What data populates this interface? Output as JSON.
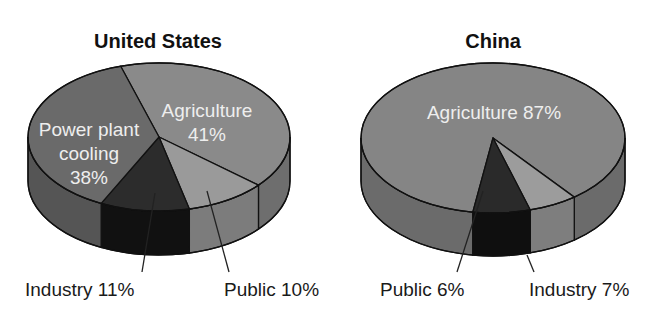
{
  "chart_data": [
    {
      "type": "pie",
      "style": "3d",
      "title": "United States",
      "slices": [
        {
          "label": "Agriculture",
          "value": 41,
          "display": [
            "Agriculture",
            "41%"
          ],
          "label_position": "inside",
          "color_top": "#8a8a8a",
          "color_side": "#6e6e6e"
        },
        {
          "label": "Public",
          "value": 10,
          "display": [
            "Public 10%"
          ],
          "label_position": "outside-below",
          "color_top": "#9a9a9a",
          "color_side": "#7c7c7c"
        },
        {
          "label": "Industry",
          "value": 11,
          "display": [
            "Industry 11%"
          ],
          "label_position": "outside-below",
          "color_top": "#2c2c2c",
          "color_side": "#111111"
        },
        {
          "label": "Power plant cooling",
          "value": 38,
          "display": [
            "Power plant",
            "cooling",
            "38%"
          ],
          "label_position": "inside",
          "color_top": "#6a6a6a",
          "color_side": "#555555"
        }
      ]
    },
    {
      "type": "pie",
      "style": "3d",
      "title": "China",
      "slices": [
        {
          "label": "Agriculture",
          "value": 87,
          "display": [
            "Agriculture 87%"
          ],
          "label_position": "inside",
          "color_top": "#858585",
          "color_side": "#6b6b6b"
        },
        {
          "label": "Public",
          "value": 6,
          "display": [
            "Public 6%"
          ],
          "label_position": "outside-below",
          "color_top": "#9c9c9c",
          "color_side": "#7e7e7e"
        },
        {
          "label": "Industry",
          "value": 7,
          "display": [
            "Industry 7%"
          ],
          "label_position": "outside-below",
          "color_top": "#2a2a2a",
          "color_side": "#0f0f0f"
        }
      ]
    }
  ],
  "charts": {
    "us": {
      "title": "United States",
      "agriculture_line1": "Agriculture",
      "agriculture_line2": "41%",
      "power_line1": "Power plant",
      "power_line2": "cooling",
      "power_line3": "38%",
      "industry_label": "Industry 11%",
      "public_label": "Public 10%"
    },
    "china": {
      "title": "China",
      "agriculture_label": "Agriculture 87%",
      "public_label": "Public 6%",
      "industry_label": "Industry 7%"
    }
  }
}
